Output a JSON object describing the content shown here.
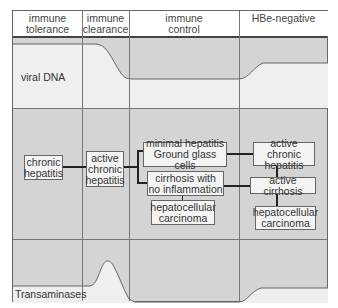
{
  "header": {
    "columns": [
      {
        "line1": "immune",
        "line2": "tolerance"
      },
      {
        "line1": "immune",
        "line2": "clearance"
      },
      {
        "line1": "immune",
        "line2": "control"
      },
      {
        "line1": "HBe-negative",
        "line2": ""
      }
    ]
  },
  "rows": {
    "viral_dna": {
      "label": "viral DNA"
    },
    "transaminases": {
      "label": "Transaminases"
    }
  },
  "boxes": {
    "chronic_hepatitis": {
      "line1": "chronic",
      "line2": "hepatitis"
    },
    "active_chronic_hepatitis_1": {
      "line1": "active",
      "line2": "chronic",
      "line3": "hepatitis"
    },
    "minimal_hepatitis": {
      "line1": "minimal hepatitis",
      "line2": "Ground glass cells"
    },
    "cirrhosis_no_inflammation": {
      "line1": "cirrhosis with",
      "line2": "no inflammation"
    },
    "hcc_1": {
      "line1": "hepatocellular",
      "line2": "carcinoma"
    },
    "active_chronic_hepatitis_2": {
      "line1": "active chronic",
      "line2": "hepatitis"
    },
    "active_cirrhosis": {
      "line1": "active cirrhosis"
    },
    "hcc_2": {
      "line1": "hepatocellular",
      "line2": "carcinoma"
    }
  },
  "colors": {
    "background_gray": "#d4d4d4",
    "curve_fill": "#efefef",
    "box_fill": "#f4f4f4",
    "grid_line": "#777777"
  }
}
